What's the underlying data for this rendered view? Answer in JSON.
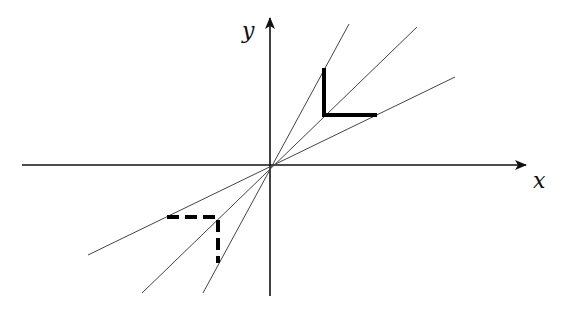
{
  "diagram": {
    "axes": {
      "origin": [
        270,
        165
      ],
      "x_axis": {
        "label": "x",
        "from": [
          22,
          165
        ],
        "to": [
          526,
          165
        ],
        "label_pos": [
          533,
          188
        ]
      },
      "y_axis": {
        "label": "y",
        "from": [
          270,
          296
        ],
        "to": [
          270,
          18
        ],
        "label_pos": [
          242,
          38
        ]
      }
    },
    "lines": [
      {
        "name": "steep-line",
        "from": [
          203,
          293
        ],
        "to": [
          349,
          24
        ]
      },
      {
        "name": "middle-line",
        "from": [
          142,
          293
        ],
        "to": [
          417,
          27
        ]
      },
      {
        "name": "shallow-line",
        "from": [
          88,
          255
        ],
        "to": [
          455,
          77
        ]
      }
    ],
    "solid_corner": {
      "points": [
        [
          324,
          68
        ],
        [
          324,
          115
        ],
        [
          377,
          115
        ]
      ],
      "stroke_width": 4
    },
    "dashed_corner": {
      "points": [
        [
          167,
          217
        ],
        [
          218,
          217
        ],
        [
          218,
          263
        ]
      ],
      "stroke_width": 4,
      "dash": "12,6"
    },
    "colors": {
      "axis": "#111111",
      "line": "#444444",
      "shape": "#000000"
    }
  }
}
